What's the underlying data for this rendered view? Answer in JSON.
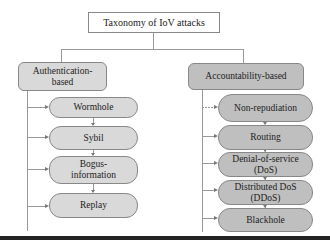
{
  "diagram": {
    "root": {
      "label": "Taxonomy of IoV attacks"
    },
    "categories": [
      {
        "label": "Authentication-\nbased",
        "label_lines": [
          "Authentication-",
          "based"
        ],
        "fill": "#d9d9d9",
        "children": [
          {
            "lines": [
              "Wormhole"
            ]
          },
          {
            "lines": [
              "Sybil"
            ]
          },
          {
            "lines": [
              "Bogus-",
              "information"
            ]
          },
          {
            "lines": [
              "Replay"
            ]
          }
        ]
      },
      {
        "label": "Accountability-based",
        "label_lines": [
          "Accountability-based"
        ],
        "fill": "#bfbfbf",
        "children": [
          {
            "lines": [
              "Non-repudiation"
            ]
          },
          {
            "lines": [
              "Routing"
            ]
          },
          {
            "lines": [
              "Denial-of-service",
              "(DoS)"
            ]
          },
          {
            "lines": [
              "Distributed DoS",
              "(DDoS)"
            ]
          },
          {
            "lines": [
              "Blackhole"
            ]
          }
        ]
      }
    ],
    "colors": {
      "border": "#888888",
      "connector": "#999999",
      "bottom_rule": "#222222"
    }
  }
}
